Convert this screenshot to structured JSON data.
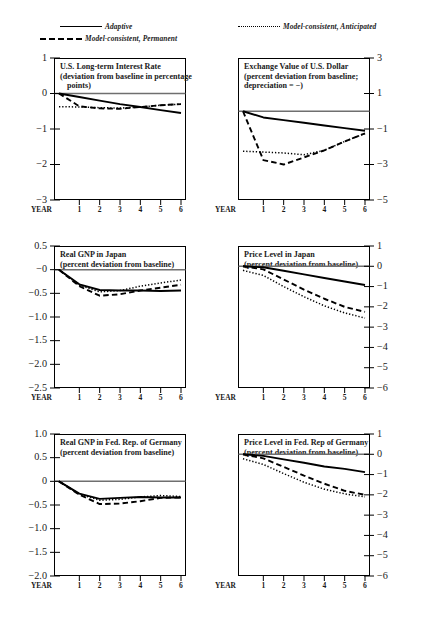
{
  "legend": {
    "items": [
      {
        "label": "Adaptive",
        "style": "solid",
        "x": 60,
        "y": 0
      },
      {
        "label": "Model-consistent, Permanent",
        "style": "dashed",
        "x": 40,
        "y": 12
      },
      {
        "label": "Model-consistent, Anticipated",
        "style": "dotted",
        "x": 238,
        "y": 0
      }
    ]
  },
  "axis": {
    "year_label": "YEAR",
    "x_ticks": [
      "1",
      "2",
      "3",
      "4",
      "5",
      "6"
    ]
  },
  "chart_data": [
    {
      "type": "line",
      "panel": 1,
      "title": [
        "U.S. Long-term Interest Rate",
        "(deviation from baseline in percentage",
        "points)"
      ],
      "xlabel": "YEAR",
      "ylabel": "",
      "axis_side": "left",
      "ylim": [
        -3,
        1
      ],
      "yticks": [
        1,
        0,
        -1,
        -2,
        -3
      ],
      "ytick_labels": [
        "1",
        "0",
        "−1",
        "−2",
        "−3"
      ],
      "x": [
        0,
        1,
        2,
        3,
        4,
        5,
        6
      ],
      "series": [
        {
          "name": "Adaptive",
          "style": "solid",
          "values": [
            0,
            -0.1,
            -0.2,
            -0.3,
            -0.38,
            -0.47,
            -0.55
          ]
        },
        {
          "name": "Model-consistent, Permanent",
          "style": "dashed",
          "values": [
            0,
            -0.36,
            -0.42,
            -0.43,
            -0.38,
            -0.33,
            -0.3
          ]
        },
        {
          "name": "Model-consistent, Anticipated",
          "style": "dotted",
          "values": [
            -0.37,
            -0.38,
            -0.4,
            -0.41,
            -0.38,
            -0.33,
            -0.3
          ]
        }
      ]
    },
    {
      "type": "line",
      "panel": 2,
      "title": [
        "Exchange Value of U.S. Dollar",
        "(percent deviation from baseline;",
        "depreciation  =  −)"
      ],
      "xlabel": "YEAR",
      "ylabel": "",
      "axis_side": "right",
      "ylim": [
        -5,
        3
      ],
      "yticks": [
        3,
        1,
        -1,
        -3,
        -5
      ],
      "ytick_labels": [
        "3",
        "1",
        "−1",
        "−3",
        "−5"
      ],
      "x": [
        0,
        1,
        2,
        3,
        4,
        5,
        6
      ],
      "series": [
        {
          "name": "Adaptive",
          "style": "solid",
          "values": [
            0,
            -0.35,
            -0.5,
            -0.65,
            -0.8,
            -0.95,
            -1.1
          ]
        },
        {
          "name": "Model-consistent, Permanent",
          "style": "dashed",
          "values": [
            0,
            -2.75,
            -3.0,
            -2.6,
            -2.2,
            -1.7,
            -1.25
          ]
        },
        {
          "name": "Model-consistent, Anticipated",
          "style": "dotted",
          "values": [
            -2.25,
            -2.3,
            -2.35,
            -2.45,
            -2.2,
            -1.7,
            -1.25
          ]
        }
      ]
    },
    {
      "type": "line",
      "panel": 3,
      "title": [
        "Real GNP in Japan",
        "(percent deviation from baseline)"
      ],
      "xlabel": "YEAR",
      "ylabel": "",
      "axis_side": "left",
      "ylim": [
        -2.5,
        0.5
      ],
      "yticks": [
        0.5,
        0,
        -0.5,
        -1.0,
        -1.5,
        -2.0,
        -2.5
      ],
      "ytick_labels": [
        "0.5",
        "−0",
        "−0.5",
        "−1.0",
        "−1.5",
        "−2.0",
        "−2.5"
      ],
      "x": [
        0,
        1,
        2,
        3,
        4,
        5,
        6
      ],
      "series": [
        {
          "name": "Adaptive",
          "style": "solid",
          "values": [
            0,
            -0.31,
            -0.43,
            -0.44,
            -0.44,
            -0.45,
            -0.44
          ]
        },
        {
          "name": "Model-consistent, Permanent",
          "style": "dashed",
          "values": [
            0,
            -0.35,
            -0.55,
            -0.52,
            -0.44,
            -0.38,
            -0.32
          ]
        },
        {
          "name": "Model-consistent, Anticipated",
          "style": "dotted",
          "values": [
            0,
            -0.33,
            -0.47,
            -0.44,
            -0.35,
            -0.28,
            -0.22
          ]
        }
      ]
    },
    {
      "type": "line",
      "panel": 4,
      "title": [
        "Price Level in Japan",
        "(percent deviation from baseline)"
      ],
      "xlabel": "YEAR",
      "ylabel": "",
      "axis_side": "right",
      "ylim": [
        -6,
        1
      ],
      "yticks": [
        1,
        0,
        -1,
        -2,
        -3,
        -4,
        -5,
        -6
      ],
      "ytick_labels": [
        "1",
        "0",
        "−1",
        "−2",
        "−3",
        "−4",
        "−5",
        "−6"
      ],
      "x": [
        0,
        1,
        2,
        3,
        4,
        5,
        6
      ],
      "series": [
        {
          "name": "Adaptive",
          "style": "solid",
          "values": [
            0,
            -0.05,
            -0.22,
            -0.4,
            -0.58,
            -0.75,
            -0.92
          ]
        },
        {
          "name": "Model-consistent, Permanent",
          "style": "dashed",
          "values": [
            0,
            -0.15,
            -0.65,
            -1.15,
            -1.6,
            -2.0,
            -2.25
          ]
        },
        {
          "name": "Model-consistent, Anticipated",
          "style": "dotted",
          "values": [
            -0.2,
            -0.45,
            -1.0,
            -1.5,
            -1.95,
            -2.3,
            -2.55
          ]
        }
      ]
    },
    {
      "type": "line",
      "panel": 5,
      "title": [
        "Real GNP in Fed. Rep. of Germany",
        "(percent deviation from baseline)"
      ],
      "xlabel": "YEAR",
      "ylabel": "",
      "axis_side": "left",
      "ylim": [
        -2.0,
        1.0
      ],
      "yticks": [
        1.0,
        0.5,
        0,
        -0.5,
        -1.0,
        -1.5,
        -2.0
      ],
      "ytick_labels": [
        "1.0",
        "0.5",
        "0",
        "−0.5",
        "−1.0",
        "−1.5",
        "−2.0"
      ],
      "x": [
        0,
        1,
        2,
        3,
        4,
        5,
        6
      ],
      "series": [
        {
          "name": "Adaptive",
          "style": "solid",
          "values": [
            0,
            -0.26,
            -0.37,
            -0.35,
            -0.33,
            -0.34,
            -0.34
          ]
        },
        {
          "name": "Model-consistent, Permanent",
          "style": "dashed",
          "values": [
            0,
            -0.28,
            -0.48,
            -0.47,
            -0.42,
            -0.35,
            -0.34
          ]
        },
        {
          "name": "Model-consistent, Anticipated",
          "style": "dotted",
          "values": [
            0,
            -0.27,
            -0.4,
            -0.38,
            -0.33,
            -0.3,
            -0.32
          ]
        }
      ]
    },
    {
      "type": "line",
      "panel": 6,
      "title": [
        "Price Level in Fed. Rep of Germany",
        "(percent deviation from baseline)"
      ],
      "xlabel": "YEAR",
      "ylabel": "",
      "axis_side": "right",
      "ylim": [
        -6,
        1
      ],
      "yticks": [
        1,
        0,
        -1,
        -2,
        -3,
        -4,
        -5,
        -6
      ],
      "ytick_labels": [
        "1",
        "0",
        "−1",
        "−2",
        "−3",
        "−4",
        "−5",
        "−6"
      ],
      "x": [
        0,
        1,
        2,
        3,
        4,
        5,
        6
      ],
      "series": [
        {
          "name": "Adaptive",
          "style": "solid",
          "values": [
            0,
            -0.08,
            -0.25,
            -0.42,
            -0.6,
            -0.72,
            -0.88
          ]
        },
        {
          "name": "Model-consistent, Permanent",
          "style": "dashed",
          "values": [
            0,
            -0.2,
            -0.62,
            -1.05,
            -1.45,
            -1.8,
            -2.0
          ]
        },
        {
          "name": "Model-consistent, Anticipated",
          "style": "dotted",
          "values": [
            -0.22,
            -0.5,
            -0.95,
            -1.38,
            -1.72,
            -1.95,
            -2.1
          ]
        }
      ]
    }
  ]
}
